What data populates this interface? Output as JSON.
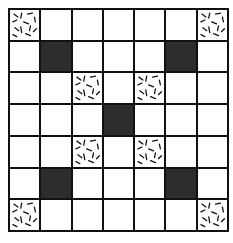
{
  "figure": {
    "rows": 7,
    "cols": 7,
    "legend": {
      "T": "textured (dashes)",
      "D": "dark (solid)",
      ".": "empty (white)"
    },
    "cells": [
      [
        "T",
        ".",
        ".",
        ".",
        ".",
        ".",
        "T"
      ],
      [
        ".",
        "D",
        ".",
        ".",
        ".",
        "D",
        "."
      ],
      [
        ".",
        ".",
        "T",
        ".",
        "T",
        ".",
        "."
      ],
      [
        ".",
        ".",
        ".",
        "D",
        ".",
        ".",
        "."
      ],
      [
        ".",
        ".",
        "T",
        ".",
        "T",
        ".",
        "."
      ],
      [
        ".",
        "D",
        ".",
        ".",
        ".",
        "D",
        "."
      ],
      [
        "T",
        ".",
        ".",
        ".",
        ".",
        ".",
        "T"
      ]
    ],
    "colors": {
      "line": "#111111",
      "dark": "#222222",
      "empty": "#ffffff"
    }
  }
}
